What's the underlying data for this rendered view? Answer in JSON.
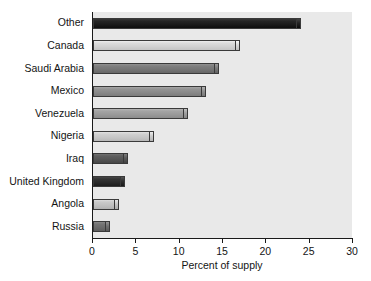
{
  "chart_data": {
    "type": "bar",
    "orientation": "horizontal",
    "title": "",
    "subtitle": "",
    "xlabel": "Percent of supply",
    "ylabel": "",
    "xlim": [
      0,
      30
    ],
    "xticks": [
      0,
      5,
      10,
      15,
      20,
      25,
      30
    ],
    "xtick_labels": [
      "0",
      "5",
      "10",
      "15",
      "20",
      "25",
      "30"
    ],
    "grid": false,
    "legend": null,
    "categories": [
      "Other",
      "Canada",
      "Saudi Arabia",
      "Mexico",
      "Venezuela",
      "Nigeria",
      "Iraq",
      "United Kingdom",
      "Angola",
      "Russia"
    ],
    "values": [
      24.0,
      17.0,
      14.5,
      13.0,
      11.0,
      7.0,
      4.0,
      3.7,
      3.0,
      2.0
    ],
    "bar_colors": [
      "#1c1c1c",
      "#d2d2d2",
      "#757575",
      "#8a8a8a",
      "#9a9a9a",
      "#c6c6c6",
      "#555555",
      "#2b2b2b",
      "#c0c0c0",
      "#6b6b6b"
    ],
    "plot_background": "#e9e9e9",
    "axis_color": "#1a1a1a"
  },
  "footer": {
    "artifact_text": ""
  }
}
